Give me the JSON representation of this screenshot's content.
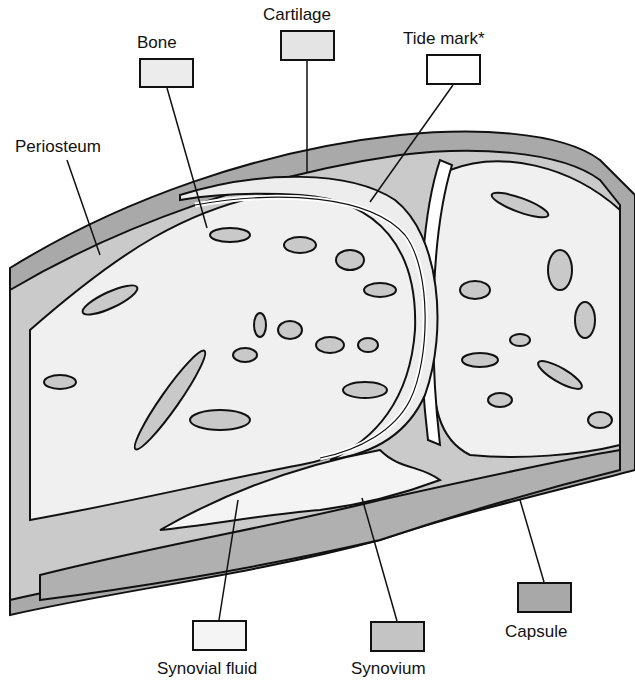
{
  "diagram": {
    "labels": [
      {
        "id": "bone",
        "text": "Bone",
        "key_fill": "#ececec",
        "x": 137,
        "y": 34,
        "box": [
          139,
          58,
          55,
          30
        ]
      },
      {
        "id": "cartilage",
        "text": "Cartilage",
        "key_fill": "#e4e4e4",
        "x": 263,
        "y": 6,
        "box": [
          280,
          30,
          55,
          31
        ]
      },
      {
        "id": "tide-mark",
        "text": "Tide mark*",
        "key_fill": "#ffffff",
        "x": 403,
        "y": 30,
        "box": [
          426,
          54,
          55,
          31
        ]
      },
      {
        "id": "periosteum",
        "text": "Periosteum",
        "x": 15,
        "y": 138
      },
      {
        "id": "synovial-fluid",
        "text": "Synovial fluid",
        "key_fill": "#f4f4f4",
        "x": 157,
        "y": 660,
        "box": [
          192,
          620,
          55,
          31
        ]
      },
      {
        "id": "synovium",
        "text": "Synovium",
        "key_fill": "#c4c4c4",
        "x": 351,
        "y": 660,
        "box": [
          370,
          621,
          55,
          31
        ]
      },
      {
        "id": "capsule",
        "text": "Capsule",
        "key_fill": "#a8a8a8",
        "x": 505,
        "y": 623,
        "box": [
          517,
          582,
          55,
          31
        ]
      }
    ],
    "colors": {
      "capsule": "#a9a9a9",
      "synovium": "#c6c6c6",
      "bone_trabeculae": "#c9c9c9",
      "marrow": "#f0f0f0",
      "cartilage": "#ededed",
      "outline": "#111111"
    }
  }
}
